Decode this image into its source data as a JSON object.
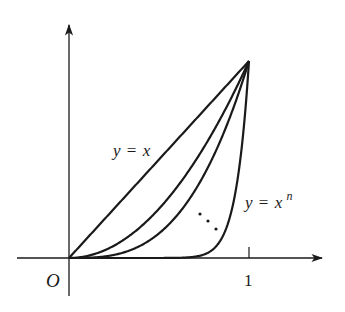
{
  "figure": {
    "origin_label": "O",
    "x_tick_label": "1",
    "curve_label_linear": {
      "lhs": "y",
      "eq": "=",
      "rhs": "x"
    },
    "curve_label_power": {
      "lhs": "y",
      "eq": "=",
      "base": "x",
      "exp": "n"
    },
    "ellipsis": "⋱",
    "stroke_color": "#1a1a1a",
    "background": "#ffffff"
  },
  "geometry": {
    "origin_px": [
      69,
      258
    ],
    "unit_px": [
      249,
      61
    ],
    "x_axis": {
      "x_start": 17,
      "x_end": 322
    },
    "y_axis": {
      "y_top": 25,
      "y_bottom": 296
    },
    "dots": [
      [
        200,
        214
      ],
      [
        208,
        221
      ],
      [
        216,
        229
      ]
    ]
  },
  "chart_data": {
    "type": "line",
    "title": "",
    "xlabel": "",
    "ylabel": "",
    "xlim": [
      0,
      1
    ],
    "ylim": [
      0,
      1
    ],
    "x_ticks": [
      1
    ],
    "series": [
      {
        "name": "y = x",
        "exponent": 1
      },
      {
        "name": "y = x^2",
        "exponent": 2
      },
      {
        "name": "y = x^3",
        "exponent": 3
      },
      {
        "name": "y = x^n",
        "exponent": 14
      }
    ],
    "annotations": [
      "y = x",
      "y = x^n",
      "O",
      "1",
      "⋯ (increasing n)"
    ]
  }
}
